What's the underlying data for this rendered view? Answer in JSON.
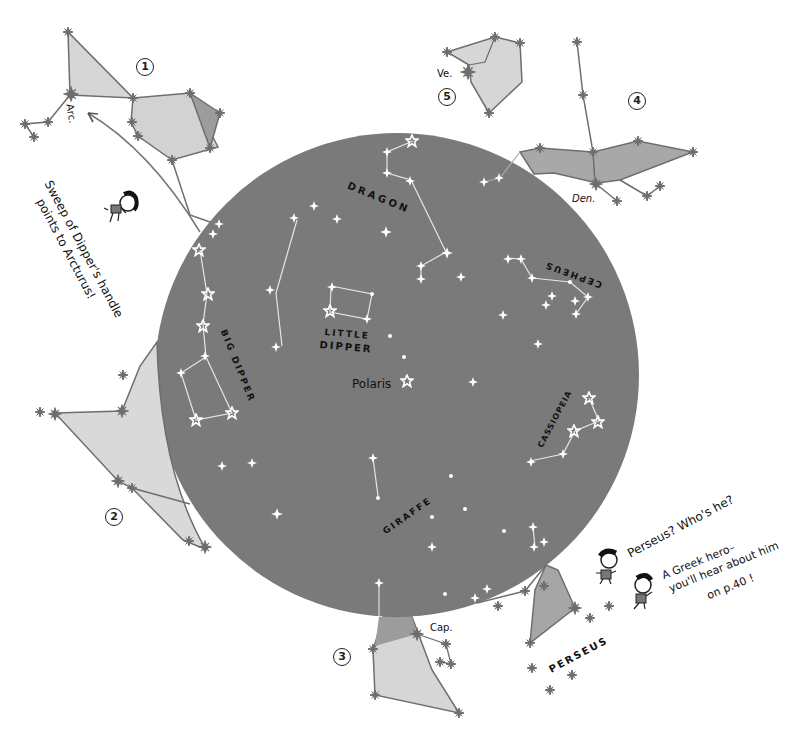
{
  "colors": {
    "sky_disc": "#7a7a7a",
    "outer_fill_light": "#d9d9d9",
    "outer_fill_dark": "#9c9c9c",
    "outer_line": "#6e6e6e",
    "inner_line": "#e8e8e8",
    "inner_star": "#ffffff",
    "text": "#111111"
  },
  "inner_constellations": {
    "dragon": "DRAGON",
    "little_dipper_line1": "LITTLE",
    "little_dipper_line2": "DIPPER",
    "polaris": "Polaris",
    "cepheus": "CEPHEUS",
    "big_dipper": "BIG DIPPER",
    "cassiopeia": "CASSIOPEIA",
    "giraffe": "GIRAFFE"
  },
  "outer_constellations": {
    "perseus": "PERSEUS",
    "arcturus_abbr": "Arc.",
    "vega_abbr": "Ve.",
    "deneb_abbr": "Den.",
    "capella_abbr": "Cap."
  },
  "region_numbers": [
    "1",
    "2",
    "3",
    "4",
    "5"
  ],
  "callouts": {
    "sweep_line1": "Sweep of Dipper's handle",
    "sweep_line2": "points to Arcturus!",
    "perseus_question": "Perseus? Who's he?",
    "greek_hero_line1": "A Greek hero–",
    "greek_hero_line2": "you'll hear about him",
    "greek_hero_line3": "on p.40 !"
  }
}
